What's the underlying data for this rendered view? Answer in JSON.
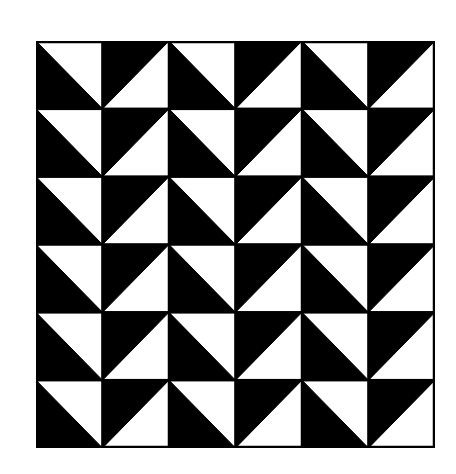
{
  "figure": {
    "title": "",
    "rows": 6,
    "columns": 6,
    "colors": {
      "dark": "#000000",
      "light": "#ffffff",
      "border": "#000000"
    },
    "column_types": [
      "A",
      "B",
      "A",
      "B",
      "A",
      "B"
    ],
    "cell_types": {
      "A": {
        "description": "diagonal from top-left to bottom-right; light upper-right triangle, dark lower-left triangle",
        "light_triangle": "upper-right",
        "dark_triangle": "lower-left"
      },
      "B": {
        "description": "diagonal from bottom-left to top-right; dark upper-left triangle, light lower-right triangle",
        "light_triangle": "lower-right",
        "dark_triangle": "upper-left"
      }
    },
    "grid": [
      [
        "A",
        "B",
        "A",
        "B",
        "A",
        "B"
      ],
      [
        "A",
        "B",
        "A",
        "B",
        "A",
        "B"
      ],
      [
        "A",
        "B",
        "A",
        "B",
        "A",
        "B"
      ],
      [
        "A",
        "B",
        "A",
        "B",
        "A",
        "B"
      ],
      [
        "A",
        "B",
        "A",
        "B",
        "A",
        "B"
      ],
      [
        "A",
        "B",
        "A",
        "B",
        "A",
        "B"
      ]
    ]
  }
}
